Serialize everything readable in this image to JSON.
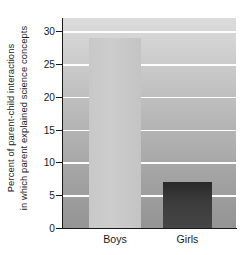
{
  "chart_data": {
    "type": "bar",
    "title": "",
    "subtitle": "",
    "xlabel": "",
    "ylabel": "Percent of parent-child interactions in which parent explained science concepts",
    "ylabel_lines": [
      "Percent of parent-child interactions",
      "in which parent explained science concepts"
    ],
    "categories": [
      "Boys",
      "Girls"
    ],
    "values": [
      29,
      7
    ],
    "series": [
      {
        "name": "Percent of parent-child interactions in which parent explained science concepts",
        "values": [
          29,
          7
        ]
      }
    ],
    "ylim": [
      0,
      32
    ],
    "yticks": [
      0,
      5,
      10,
      15,
      20,
      25,
      30
    ],
    "ytick_labels": [
      "0",
      "5",
      "10",
      "15",
      "20",
      "25",
      "30"
    ],
    "grid": true,
    "grid_orientation": "horizontal",
    "grid_color": "#fdfdfd",
    "legend": false,
    "legend_position": "none",
    "annotations": [],
    "bar_colors": [
      "#c9c9c9",
      "#3a3a3a"
    ],
    "plot_background": "#b4b4b4",
    "axis_color": "#1a1a1a",
    "figure_background": "#ffffff"
  }
}
